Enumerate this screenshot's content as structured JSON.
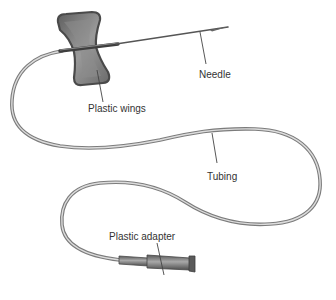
{
  "diagram": {
    "labels": {
      "needle": "Needle",
      "wings": "Plastic wings",
      "tubing": "Tubing",
      "adapter": "Plastic adapter"
    },
    "colors": {
      "background": "#ffffff",
      "wing_fill": "#7a7a7a",
      "wing_edge": "#4a4a4a",
      "tube_outer": "#7c7c7c",
      "tube_inner": "#d8d8d8",
      "needle": "#555555",
      "leader_line": "#444444",
      "label_text": "#333333"
    }
  }
}
